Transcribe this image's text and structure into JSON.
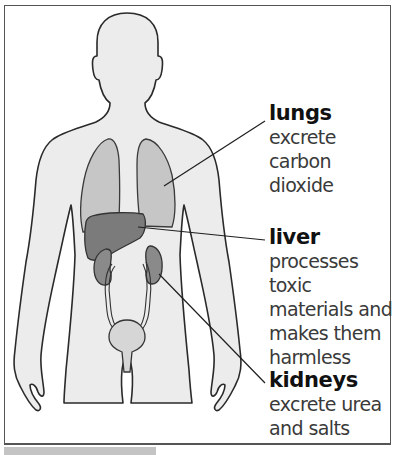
{
  "labels": {
    "lungs": {
      "title": "lungs",
      "lines": [
        "excrete carbon",
        "dioxide"
      ]
    },
    "liver": {
      "title": "liver",
      "lines": [
        "processes toxic",
        "materials and",
        "makes them",
        "harmless"
      ]
    },
    "kidneys": {
      "title": "kidneys",
      "lines": [
        "excrete urea",
        "and salts"
      ]
    }
  },
  "colors": {
    "body_fill": "#ececec",
    "lung_fill": "#c6c6c6",
    "liver_fill": "#7b7b7b",
    "kidney_fill": "#8a8a8a",
    "bladder_fill": "#d6d6d6",
    "outline": "#2a2a2a"
  }
}
